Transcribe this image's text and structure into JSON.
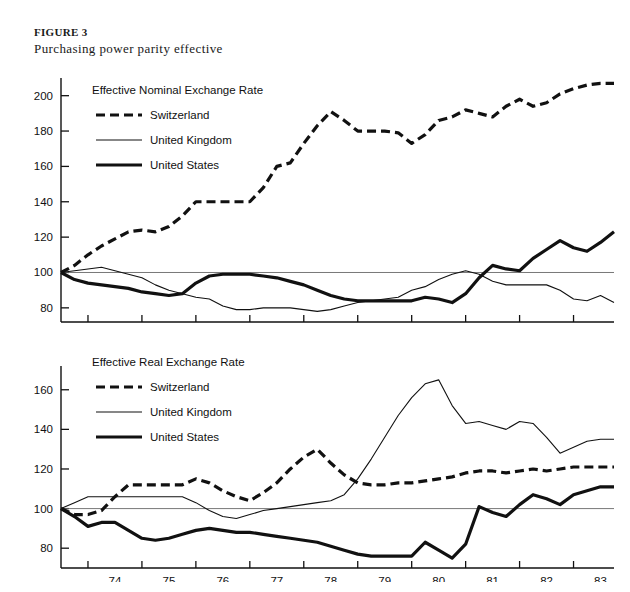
{
  "figure": {
    "label": "FIGURE 3",
    "title": "Purchasing power parity effective"
  },
  "chart_data": [
    {
      "type": "line",
      "title": "Effective Nominal Exchange Rate",
      "xlabel": "",
      "ylabel": "",
      "xlim": [
        1973.5,
        1983.75
      ],
      "ylim": [
        72,
        210
      ],
      "yticks": [
        80,
        100,
        120,
        140,
        160,
        180,
        200
      ],
      "ytick_labels": [
        "80",
        "100",
        "120",
        "140",
        "160",
        "180",
        "200"
      ],
      "xticks": [
        1974,
        1975,
        1976,
        1977,
        1978,
        1979,
        1980,
        1981,
        1982,
        1983
      ],
      "xtick_labels": [
        "74",
        "75",
        "76",
        "77",
        "78",
        "79",
        "80",
        "81",
        "82",
        "83"
      ],
      "reference_line": 100,
      "grid": false,
      "legend_position": "upper-left",
      "x": [
        1973.5,
        1973.75,
        1974.0,
        1974.25,
        1974.5,
        1974.75,
        1975.0,
        1975.25,
        1975.5,
        1975.75,
        1976.0,
        1976.25,
        1976.5,
        1976.75,
        1977.0,
        1977.25,
        1977.5,
        1977.75,
        1978.0,
        1978.25,
        1978.5,
        1978.75,
        1979.0,
        1979.25,
        1979.5,
        1979.75,
        1980.0,
        1980.25,
        1980.5,
        1980.75,
        1981.0,
        1981.25,
        1981.5,
        1981.75,
        1982.0,
        1982.25,
        1982.5,
        1982.75,
        1983.0,
        1983.25,
        1983.5,
        1983.75
      ],
      "series": [
        {
          "name": "Switzerland",
          "style": "dashed",
          "values": [
            100,
            104,
            110,
            115,
            119,
            123,
            124,
            123,
            126,
            132,
            140,
            140,
            140,
            140,
            140,
            148,
            160,
            162,
            173,
            183,
            191,
            186,
            180,
            180,
            180,
            179,
            173,
            178,
            186,
            188,
            192,
            190,
            188,
            194,
            198,
            194,
            196,
            201,
            204,
            206,
            207,
            207
          ]
        },
        {
          "name": "United Kingdom",
          "style": "thin",
          "values": [
            100,
            101,
            102,
            103,
            101,
            99,
            97,
            93,
            90,
            88,
            86,
            85,
            81,
            79,
            79,
            80,
            80,
            80,
            79,
            78,
            79,
            81,
            83,
            84,
            85,
            86,
            90,
            92,
            96,
            99,
            101,
            99,
            95,
            93,
            93,
            93,
            93,
            90,
            85,
            84,
            87,
            83
          ]
        },
        {
          "name": "United States",
          "style": "thick",
          "values": [
            100,
            96,
            94,
            93,
            92,
            91,
            89,
            88,
            87,
            88,
            94,
            98,
            99,
            99,
            99,
            98,
            97,
            95,
            93,
            90,
            87,
            85,
            84,
            84,
            84,
            84,
            84,
            86,
            85,
            83,
            88,
            97,
            104,
            102,
            101,
            108,
            113,
            118,
            114,
            112,
            117,
            123
          ]
        }
      ]
    },
    {
      "type": "line",
      "title": "Effective Real Exchange Rate",
      "xlabel": "",
      "ylabel": "",
      "xlim": [
        1973.5,
        1983.75
      ],
      "ylim": [
        70,
        172
      ],
      "yticks": [
        80,
        100,
        120,
        140,
        160
      ],
      "ytick_labels": [
        "80",
        "100",
        "120",
        "140",
        "160"
      ],
      "xticks": [
        1974,
        1975,
        1976,
        1977,
        1978,
        1979,
        1980,
        1981,
        1982,
        1983
      ],
      "xtick_labels": [
        "74",
        "75",
        "76",
        "77",
        "78",
        "79",
        "80",
        "81",
        "82",
        "83"
      ],
      "reference_line": 100,
      "grid": false,
      "legend_position": "upper-left",
      "x": [
        1973.5,
        1973.75,
        1974.0,
        1974.25,
        1974.5,
        1974.75,
        1975.0,
        1975.25,
        1975.5,
        1975.75,
        1976.0,
        1976.25,
        1976.5,
        1976.75,
        1977.0,
        1977.25,
        1977.5,
        1977.75,
        1978.0,
        1978.25,
        1978.5,
        1978.75,
        1979.0,
        1979.25,
        1979.5,
        1979.75,
        1980.0,
        1980.25,
        1980.5,
        1980.75,
        1981.0,
        1981.25,
        1981.5,
        1981.75,
        1982.0,
        1982.25,
        1982.5,
        1982.75,
        1983.0,
        1983.25,
        1983.5,
        1983.75
      ],
      "series": [
        {
          "name": "Switzerland",
          "style": "dashed",
          "values": [
            100,
            97,
            97,
            99,
            106,
            112,
            112,
            112,
            112,
            112,
            115,
            113,
            109,
            106,
            104,
            108,
            113,
            120,
            126,
            130,
            123,
            117,
            113,
            112,
            112,
            113,
            113,
            114,
            115,
            116,
            118,
            119,
            119,
            118,
            119,
            120,
            119,
            120,
            121,
            121,
            121,
            121
          ]
        },
        {
          "name": "United Kingdom",
          "style": "thin",
          "values": [
            100,
            103,
            106,
            106,
            106,
            106,
            106,
            106,
            106,
            106,
            103,
            99,
            96,
            95,
            97,
            99,
            100,
            101,
            102,
            103,
            104,
            107,
            115,
            125,
            136,
            147,
            156,
            163,
            165,
            152,
            143,
            144,
            142,
            140,
            144,
            143,
            136,
            128,
            131,
            134,
            135,
            135
          ]
        },
        {
          "name": "United States",
          "style": "thick",
          "values": [
            100,
            96,
            91,
            93,
            93,
            89,
            85,
            84,
            85,
            87,
            89,
            90,
            89,
            88,
            88,
            87,
            86,
            85,
            84,
            83,
            81,
            79,
            77,
            76,
            76,
            76,
            76,
            83,
            79,
            75,
            82,
            101,
            98,
            96,
            102,
            107,
            105,
            102,
            107,
            109,
            111,
            111
          ]
        }
      ]
    }
  ]
}
